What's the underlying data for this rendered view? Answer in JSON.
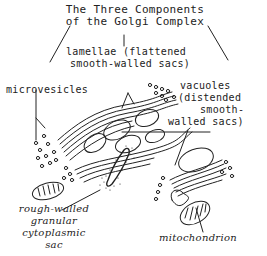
{
  "diagram": {
    "title_line1": "The Three Components",
    "title_line2": "of the Golgi Complex",
    "labels": {
      "lamellae_line1": "lamellae (flattened",
      "lamellae_line2": "smooth-walled sacs)",
      "microvesicles": "microvesicles",
      "vacuoles_line1": "vacuoles",
      "vacuoles_line2": "(distended",
      "vacuoles_line3": "smooth-",
      "vacuoles_line4": "walled sacs)",
      "rough_line1": "rough-walled",
      "rough_line2": "granular",
      "rough_line3": "cytoplasmic",
      "rough_line4": "sac",
      "mitochondrion": "mitochondrion"
    },
    "stroke_color": "#222222",
    "background": "#ffffff"
  }
}
